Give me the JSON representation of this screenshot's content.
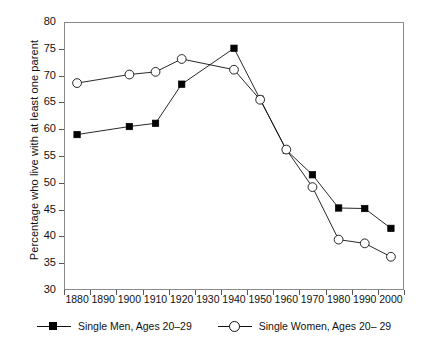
{
  "chart_data": {
    "type": "line",
    "title": "",
    "subtitle": "",
    "xlabel": "",
    "ylabel": "Percentage who live with at least one parent",
    "x": [
      1880,
      1890,
      1900,
      1910,
      1920,
      1930,
      1940,
      1950,
      1960,
      1970,
      1980,
      1990,
      2000
    ],
    "categories": [
      "1880",
      "1890",
      "1900",
      "1910",
      "1920",
      "1930",
      "1940",
      "1950",
      "1960",
      "1970",
      "1980",
      "1990",
      "2000"
    ],
    "xlim": [
      1875,
      2005
    ],
    "ylim": [
      30,
      80
    ],
    "yticks": [
      30,
      35,
      40,
      45,
      50,
      55,
      60,
      65,
      70,
      75,
      80
    ],
    "ytick_labels": [
      "30",
      "35",
      "40",
      "45",
      "50",
      "55",
      "60",
      "65",
      "70",
      "75",
      "80"
    ],
    "grid": false,
    "legend_position": "bottom",
    "series": [
      {
        "name": "Single Men, Ages 20–29",
        "marker": "filled-square",
        "color": "#000000",
        "x": [
          1880,
          1890,
          1900,
          1910,
          1920,
          1940,
          1950,
          1960,
          1970,
          1980,
          1990,
          2000
        ],
        "values": [
          59.0,
          null,
          60.5,
          61.1,
          68.4,
          75.1,
          65.6,
          56.1,
          51.5,
          45.3,
          45.2,
          41.5
        ]
      },
      {
        "name": "Single Women, Ages 20– 29",
        "marker": "open-circle",
        "color": "#000000",
        "x": [
          1880,
          1900,
          1910,
          1920,
          1940,
          1950,
          1960,
          1970,
          1980,
          1990,
          2000
        ],
        "values": [
          68.6,
          70.2,
          70.7,
          73.1,
          71.1,
          65.5,
          56.2,
          49.2,
          39.4,
          38.7,
          36.2
        ]
      }
    ],
    "points_men": [
      {
        "x": 1880,
        "y": 59.0
      },
      {
        "x": 1900,
        "y": 60.5
      },
      {
        "x": 1910,
        "y": 61.1
      },
      {
        "x": 1920,
        "y": 68.4
      },
      {
        "x": 1940,
        "y": 75.1
      },
      {
        "x": 1950,
        "y": 65.6
      },
      {
        "x": 1960,
        "y": 56.1
      },
      {
        "x": 1970,
        "y": 51.5
      },
      {
        "x": 1980,
        "y": 45.3
      },
      {
        "x": 1990,
        "y": 45.2
      },
      {
        "x": 2000,
        "y": 41.5
      }
    ],
    "points_women": [
      {
        "x": 1880,
        "y": 68.6
      },
      {
        "x": 1900,
        "y": 70.2
      },
      {
        "x": 1910,
        "y": 70.7
      },
      {
        "x": 1920,
        "y": 73.1
      },
      {
        "x": 1940,
        "y": 71.1
      },
      {
        "x": 1950,
        "y": 65.5
      },
      {
        "x": 1960,
        "y": 56.2
      },
      {
        "x": 1970,
        "y": 49.2
      },
      {
        "x": 1980,
        "y": 39.4
      },
      {
        "x": 1990,
        "y": 38.7
      },
      {
        "x": 2000,
        "y": 36.2
      }
    ]
  },
  "legend": {
    "items": [
      {
        "label": "Single Men, Ages 20–29",
        "marker": "filled-square"
      },
      {
        "label": "Single Women, Ages 20– 29",
        "marker": "open-circle"
      }
    ]
  }
}
